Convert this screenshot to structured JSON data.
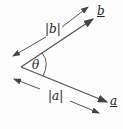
{
  "diagram": {
    "labels": {
      "vec_b": "b",
      "vec_a": "a",
      "mag_b": "|b|",
      "mag_a": "|a|",
      "angle": "θ"
    },
    "colors": {
      "line": "#444444",
      "text": "#222222"
    }
  }
}
